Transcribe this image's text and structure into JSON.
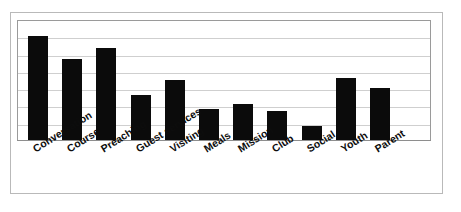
{
  "chart_data": {
    "type": "bar",
    "title": "",
    "subtitle": "",
    "xlabel": "",
    "ylabel": "",
    "categories": [
      "Conversation",
      "Course",
      "Preaching",
      "Guest services",
      "Visiting",
      "Meals",
      "Mission",
      "Club",
      "Social",
      "Youth",
      "Parent"
    ],
    "values": [
      6.0,
      4.7,
      5.3,
      2.6,
      3.5,
      1.8,
      2.1,
      1.7,
      0.8,
      3.6,
      3.0
    ],
    "ylim": [
      0,
      7
    ],
    "yticks": [
      0,
      1,
      2,
      3,
      4,
      5,
      6,
      7
    ],
    "ytick_labels": [
      "",
      "",
      "",
      "",
      "",
      "",
      "",
      ""
    ],
    "grid": true,
    "grid_axis": "y",
    "legend": false,
    "legend_position": "none",
    "bar_color": "#0b0b0b",
    "gridline_color": "#cfcfcf",
    "plot_border_color": "#9a9a9a",
    "figure_border_color": "#b9b9b9",
    "background_color": "#ffffff",
    "label_rotation_deg": -32,
    "label_style": "bold",
    "series": [
      {
        "name": "",
        "values": [
          6.0,
          4.7,
          5.3,
          2.6,
          3.5,
          1.8,
          2.1,
          1.7,
          0.8,
          3.6,
          3.0
        ]
      }
    ]
  },
  "layout": {
    "plot": {
      "left": 17,
      "top": 20,
      "width": 414,
      "height": 121
    },
    "bar_width": 20,
    "bar_pitch": 34.2,
    "first_bar_left": 10,
    "gridline_count": 6
  }
}
